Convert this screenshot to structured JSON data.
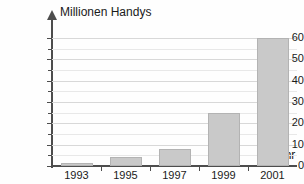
{
  "chart_data": {
    "type": "bar",
    "title": "",
    "ylabel": "Millionen Handys",
    "xlabel": "Jahr",
    "categories": [
      "1993",
      "1995",
      "1997",
      "1999",
      "2001"
    ],
    "values": [
      1.5,
      4,
      8,
      25,
      60
    ],
    "ylim": [
      0,
      65
    ],
    "yticks": [
      0,
      10,
      20,
      30,
      40,
      50,
      60
    ],
    "ytick_labels": [
      "0",
      "10",
      "20",
      "30",
      "40",
      "50",
      "60"
    ],
    "minor_yticks": [
      5,
      15,
      25,
      35,
      45,
      55
    ],
    "grid": true,
    "legend": "none",
    "bar_color": "#c9c9c9",
    "bar_edge_color": "#b3b3b3",
    "axis_color": "#4d4d4d",
    "gridline_color": "#d8d8d8",
    "text_color": "#1a1a1a",
    "background": "#ffffff"
  },
  "labels": {
    "y_axis_title": "Millionen Handys",
    "x_axis_title": "Jahr"
  }
}
